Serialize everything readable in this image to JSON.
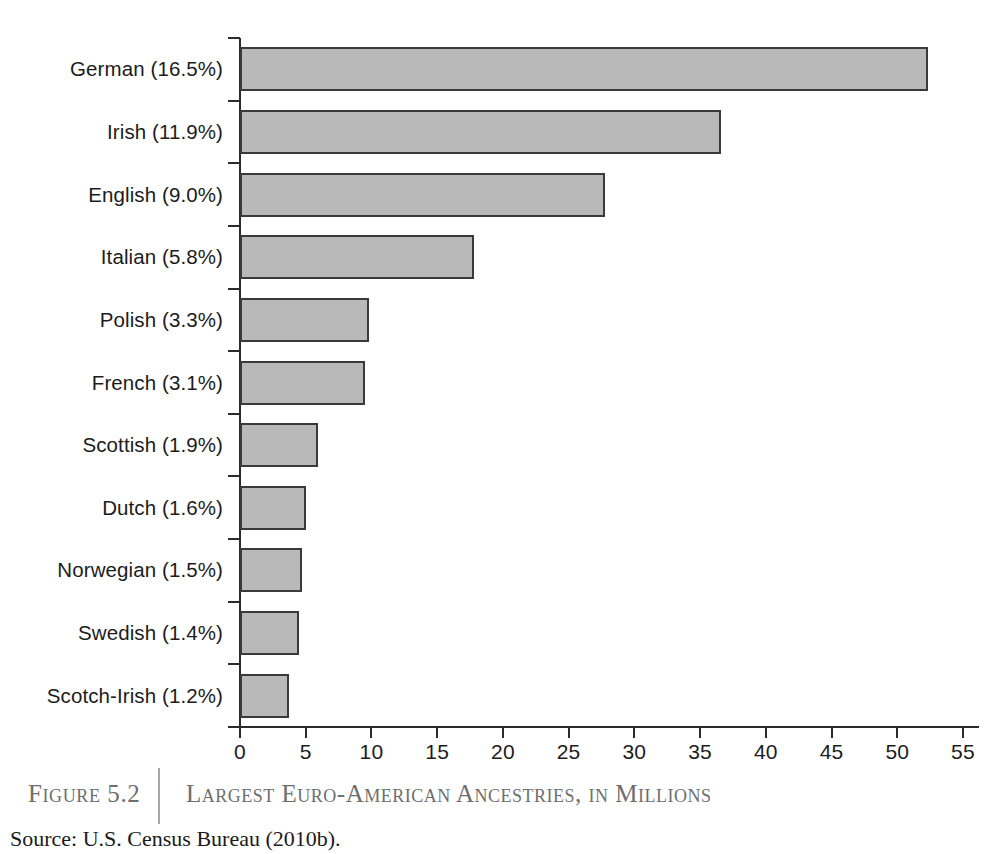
{
  "chart_data": {
    "type": "bar",
    "orientation": "horizontal",
    "title": "Largest Euro-American Ancestries, in Millions",
    "xlabel": "",
    "ylabel": "",
    "xlim": [
      0,
      55
    ],
    "xticks": [
      0,
      5,
      10,
      15,
      20,
      25,
      30,
      35,
      40,
      45,
      50,
      55
    ],
    "xtick_labels": [
      "0",
      "5",
      "10",
      "15",
      "20",
      "25",
      "30",
      "35",
      "40",
      "45",
      "50",
      "55"
    ],
    "grid": false,
    "legend": null,
    "units": "millions",
    "categories": [
      "German (16.5%)",
      "Irish (11.9%)",
      "English (9.0%)",
      "Italian (5.8%)",
      "Polish (3.3%)",
      "French (3.1%)",
      "Scottish (1.9%)",
      "Dutch (1.6%)",
      "Norwegian (1.5%)",
      "Swedish (1.4%)",
      "Scotch-Irish (1.2%)"
    ],
    "values": [
      52.3,
      36.6,
      27.8,
      17.8,
      9.8,
      9.5,
      5.9,
      5.0,
      4.7,
      4.5,
      3.7
    ],
    "percent_labels": [
      "16.5%",
      "11.9%",
      "9.0%",
      "5.8%",
      "3.3%",
      "3.1%",
      "1.9%",
      "1.6%",
      "1.5%",
      "1.4%",
      "1.2%"
    ],
    "bar_fill_color": "#b9b9b9",
    "bar_edge_color": "#3a3a3a",
    "axis_color": "#2b2b2b"
  },
  "caption": {
    "figure_label": "Figure 5.2",
    "title": "Largest Euro-American Ancestries, in Millions",
    "source": "Source: U.S. Census Bureau (2010b)."
  }
}
